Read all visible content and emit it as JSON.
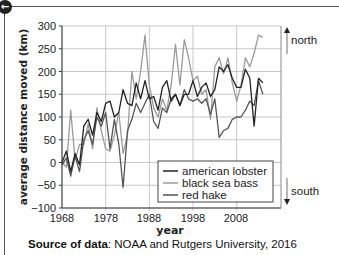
{
  "nav": {
    "back_icon": "arrow-left-icon",
    "back_glyph": "←"
  },
  "chart_data": {
    "type": "line",
    "title": "",
    "xlabel": "year",
    "ylabel": "average distance moved (km)",
    "xlim": [
      1968,
      2015
    ],
    "ylim": [
      -100,
      300
    ],
    "xticks": [
      1968,
      1978,
      1988,
      1998,
      2008
    ],
    "yticks": [
      -100,
      -50,
      0,
      50,
      100,
      150,
      200,
      250,
      300
    ],
    "ytick_labels": [
      "−100",
      "−50",
      "0",
      "50",
      "100",
      "150",
      "200",
      "250",
      "300"
    ],
    "grid": true,
    "legend_position": "lower right",
    "x": [
      1968,
      1969,
      1970,
      1971,
      1972,
      1973,
      1974,
      1975,
      1976,
      1977,
      1978,
      1979,
      1980,
      1981,
      1982,
      1983,
      1984,
      1985,
      1986,
      1987,
      1988,
      1989,
      1990,
      1991,
      1992,
      1993,
      1994,
      1995,
      1996,
      1997,
      1998,
      1999,
      2000,
      2001,
      2002,
      2003,
      2004,
      2005,
      2006,
      2007,
      2008,
      2009,
      2010,
      2011,
      2012,
      2013,
      2014
    ],
    "series": [
      {
        "name": "american lobster",
        "color": "#222222",
        "values": [
          0,
          25,
          -20,
          20,
          -5,
          80,
          95,
          60,
          110,
          90,
          130,
          135,
          100,
          110,
          160,
          130,
          125,
          175,
          140,
          180,
          140,
          145,
          115,
          165,
          180,
          135,
          150,
          125,
          150,
          150,
          180,
          145,
          165,
          175,
          145,
          160,
          210,
          200,
          215,
          185,
          165,
          165,
          205,
          185,
          80,
          185,
          175
        ]
      },
      {
        "name": "black sea bass",
        "color": "#9a9a9a",
        "values": [
          0,
          -10,
          115,
          5,
          40,
          40,
          85,
          30,
          120,
          70,
          30,
          25,
          60,
          110,
          20,
          60,
          200,
          140,
          200,
          280,
          170,
          120,
          100,
          140,
          115,
          170,
          260,
          170,
          270,
          230,
          180,
          190,
          150,
          160,
          95,
          210,
          230,
          195,
          230,
          175,
          135,
          170,
          230,
          210,
          240,
          280,
          275
        ]
      },
      {
        "name": "red hake",
        "color": "#555555",
        "values": [
          -5,
          10,
          -30,
          15,
          -20,
          50,
          70,
          40,
          100,
          80,
          110,
          30,
          95,
          40,
          -55,
          70,
          95,
          130,
          110,
          130,
          150,
          90,
          75,
          120,
          110,
          140,
          150,
          125,
          160,
          140,
          135,
          140,
          130,
          140,
          105,
          140,
          55,
          70,
          75,
          95,
          100,
          100,
          115,
          135,
          125,
          180,
          150
        ]
      }
    ]
  },
  "chart": {
    "yticks": [
      "300",
      "250",
      "200",
      "150",
      "100",
      "50",
      "0",
      "−50",
      "−100"
    ],
    "xticks": [
      "1968",
      "1978",
      "1988",
      "1998",
      "2008"
    ],
    "xlabel": "year",
    "ylabel": "average distance moved (km)",
    "legend": [
      "american lobster",
      "black sea bass",
      "red hake"
    ],
    "north_label": "north",
    "south_label": "south"
  },
  "source": {
    "label": "Source of data",
    "text": ": NOAA and Rutgers University, 2016"
  }
}
